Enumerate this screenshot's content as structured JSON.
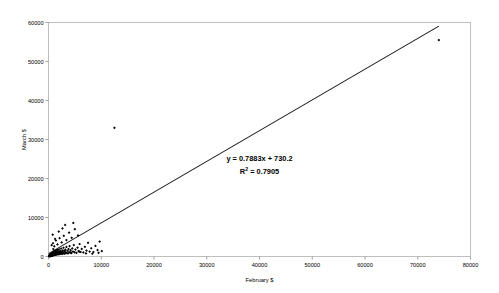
{
  "chart_data": {
    "type": "scatter",
    "title": "",
    "xlabel": "February $",
    "ylabel": "March $",
    "xlim": [
      0,
      80000
    ],
    "ylim": [
      0,
      60000
    ],
    "xticks": [
      0,
      10000,
      20000,
      30000,
      40000,
      50000,
      60000,
      70000,
      80000
    ],
    "yticks": [
      0,
      10000,
      20000,
      30000,
      40000,
      50000,
      60000
    ],
    "xtick_labels": [
      "0",
      "10000",
      "20000",
      "30000",
      "40000",
      "50000",
      "60000",
      "70000",
      "80000"
    ],
    "ytick_labels": [
      "0",
      "10000",
      "20000",
      "30000",
      "40000",
      "50000",
      "60000"
    ],
    "grid": false,
    "legend": false,
    "marker": "filled-diamond",
    "marker_color": "#000000",
    "point_count": 170,
    "series": [
      {
        "name": "February vs March",
        "points": [
          [
            120,
            90
          ],
          [
            150,
            210
          ],
          [
            180,
            140
          ],
          [
            200,
            320
          ],
          [
            210,
            95
          ],
          [
            230,
            260
          ],
          [
            250,
            180
          ],
          [
            260,
            420
          ],
          [
            280,
            150
          ],
          [
            300,
            330
          ],
          [
            310,
            240
          ],
          [
            330,
            110
          ],
          [
            350,
            480
          ],
          [
            360,
            280
          ],
          [
            380,
            200
          ],
          [
            390,
            640
          ],
          [
            400,
            160
          ],
          [
            410,
            350
          ],
          [
            430,
            250
          ],
          [
            440,
            520
          ],
          [
            450,
            130
          ],
          [
            460,
            400
          ],
          [
            470,
            300
          ],
          [
            480,
            700
          ],
          [
            490,
            220
          ],
          [
            500,
            450
          ],
          [
            510,
            330
          ],
          [
            520,
            180
          ],
          [
            530,
            590
          ],
          [
            540,
            280
          ],
          [
            550,
            380
          ],
          [
            560,
            240
          ],
          [
            570,
            820
          ],
          [
            580,
            330
          ],
          [
            590,
            470
          ],
          [
            600,
            200
          ],
          [
            610,
            560
          ],
          [
            620,
            350
          ],
          [
            630,
            680
          ],
          [
            640,
            290
          ],
          [
            650,
            430
          ],
          [
            660,
            760
          ],
          [
            670,
            310
          ],
          [
            680,
            540
          ],
          [
            690,
            230
          ],
          [
            700,
            620
          ],
          [
            710,
            400
          ],
          [
            720,
            880
          ],
          [
            730,
            340
          ],
          [
            740,
            500
          ],
          [
            750,
            270
          ],
          [
            760,
            700
          ],
          [
            770,
            420
          ],
          [
            780,
            950
          ],
          [
            790,
            360
          ],
          [
            800,
            580
          ],
          [
            820,
            310
          ],
          [
            840,
            760
          ],
          [
            850,
            460
          ],
          [
            870,
            1020
          ],
          [
            880,
            390
          ],
          [
            900,
            640
          ],
          [
            920,
            350
          ],
          [
            940,
            820
          ],
          [
            950,
            500
          ],
          [
            970,
            1150
          ],
          [
            990,
            430
          ],
          [
            1000,
            700
          ],
          [
            1020,
            380
          ],
          [
            1050,
            900
          ],
          [
            1070,
            560
          ],
          [
            1100,
            1280
          ],
          [
            1120,
            470
          ],
          [
            1150,
            780
          ],
          [
            1180,
            420
          ],
          [
            1200,
            1000
          ],
          [
            1230,
            610
          ],
          [
            1260,
            1420
          ],
          [
            1290,
            520
          ],
          [
            1320,
            860
          ],
          [
            1350,
            460
          ],
          [
            1380,
            1100
          ],
          [
            1420,
            670
          ],
          [
            1450,
            1560
          ],
          [
            1480,
            570
          ],
          [
            1520,
            940
          ],
          [
            1560,
            510
          ],
          [
            1600,
            1200
          ],
          [
            1650,
            730
          ],
          [
            1700,
            1700
          ],
          [
            1750,
            620
          ],
          [
            1800,
            1030
          ],
          [
            1850,
            560
          ],
          [
            1900,
            1320
          ],
          [
            1950,
            800
          ],
          [
            2000,
            1860
          ],
          [
            2050,
            680
          ],
          [
            2100,
            1130
          ],
          [
            2180,
            610
          ],
          [
            2250,
            1450
          ],
          [
            2320,
            880
          ],
          [
            2400,
            2050
          ],
          [
            2480,
            750
          ],
          [
            2550,
            1240
          ],
          [
            2620,
            670
          ],
          [
            2700,
            1590
          ],
          [
            2780,
            960
          ],
          [
            2850,
            2240
          ],
          [
            2930,
            820
          ],
          [
            3000,
            1360
          ],
          [
            3100,
            730
          ],
          [
            3200,
            1740
          ],
          [
            3300,
            1050
          ],
          [
            3400,
            2450
          ],
          [
            3500,
            890
          ],
          [
            3600,
            1480
          ],
          [
            3700,
            800
          ],
          [
            3800,
            1900
          ],
          [
            3900,
            1150
          ],
          [
            4000,
            2680
          ],
          [
            4100,
            970
          ],
          [
            4200,
            1620
          ],
          [
            4350,
            870
          ],
          [
            4500,
            2080
          ],
          [
            4650,
            1260
          ],
          [
            4800,
            2930
          ],
          [
            4950,
            1060
          ],
          [
            5100,
            1770
          ],
          [
            5300,
            950
          ],
          [
            5500,
            2270
          ],
          [
            5700,
            1380
          ],
          [
            5900,
            3200
          ],
          [
            6100,
            1160
          ],
          [
            6300,
            1930
          ],
          [
            6600,
            1040
          ],
          [
            6900,
            2480
          ],
          [
            7200,
            1510
          ],
          [
            7500,
            3500
          ],
          [
            7800,
            1270
          ],
          [
            8100,
            2110
          ],
          [
            8500,
            1140
          ],
          [
            8900,
            2710
          ],
          [
            9300,
            1650
          ],
          [
            9700,
            3830
          ],
          [
            10100,
            1390
          ],
          [
            600,
            2900
          ],
          [
            850,
            3400
          ],
          [
            1100,
            2600
          ],
          [
            1400,
            4100
          ],
          [
            1700,
            3100
          ],
          [
            2100,
            4700
          ],
          [
            2500,
            3600
          ],
          [
            2900,
            5300
          ],
          [
            3400,
            4200
          ],
          [
            3900,
            6100
          ],
          [
            4400,
            4800
          ],
          [
            5000,
            7000
          ],
          [
            5600,
            5400
          ],
          [
            1950,
            6400
          ],
          [
            2650,
            7200
          ],
          [
            800,
            5600
          ],
          [
            1250,
            4500
          ],
          [
            3150,
            8100
          ],
          [
            4700,
            8600
          ],
          [
            900,
            1900
          ],
          [
            1550,
            900
          ],
          [
            2350,
            1100
          ],
          [
            3050,
            1400
          ],
          [
            4250,
            1050
          ],
          [
            5850,
            1250
          ],
          [
            7100,
            800
          ],
          [
            8300,
            700
          ],
          [
            9500,
            950
          ],
          [
            12500,
            33000
          ],
          [
            74000,
            55500
          ]
        ]
      }
    ],
    "trendline": {
      "equation": "y = 0.7883x + 730.2",
      "r2_label": "R",
      "r2_sup": "2",
      "r2_value": "= 0.7905",
      "slope": 0.7883,
      "intercept": 730.2,
      "r_squared": 0.7905,
      "x_start": 0,
      "x_end": 74000,
      "color": "#1a1a1a"
    },
    "annotations": [
      {
        "text": "y = 0.7883x + 730.2",
        "x": 40000,
        "y": 24500
      },
      {
        "text": "R2 = 0.7905",
        "x": 40000,
        "y": 21200
      }
    ]
  }
}
